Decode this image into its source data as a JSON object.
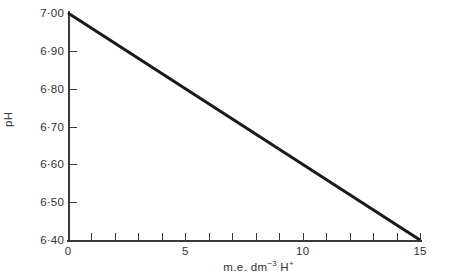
{
  "chart_data": {
    "type": "line",
    "title": "",
    "subtitle": "",
    "xlabel_parts": {
      "base": "m.e. dm",
      "exponent": "−3",
      "species": " H",
      "charge": "+"
    },
    "xlabel": "m.e. dm−3 H+",
    "ylabel": "pH",
    "xlim": [
      0,
      15
    ],
    "ylim": [
      6.4,
      7.0
    ],
    "grid": false,
    "legend": null,
    "background_color": "#ffffff",
    "axis_color": "#3a3a3a",
    "x_major_ticklabels": [
      "0",
      "5",
      "10",
      "15"
    ],
    "x_major_tickvalues": [
      0,
      5,
      10,
      15
    ],
    "x_all_tickvalues": [
      0,
      1,
      2,
      3,
      4,
      5,
      6,
      7,
      8,
      9,
      10,
      11,
      12,
      13,
      14,
      15
    ],
    "y_ticklabels": [
      "6·40",
      "6·50",
      "6·60",
      "6·70",
      "6·80",
      "6·90",
      "7·00"
    ],
    "y_tickvalues": [
      6.4,
      6.5,
      6.6,
      6.7,
      6.8,
      6.9,
      7.0
    ],
    "y_inner_tickvalues": [
      6.5,
      6.6,
      6.7,
      6.8,
      6.9
    ],
    "series": [
      {
        "name": "pH titration line",
        "color": "#1a1a1a",
        "line_width": 3,
        "x": [
          0,
          15
        ],
        "values": [
          7.0,
          6.4
        ],
        "points": [
          [
            0,
            7.0
          ],
          [
            15,
            6.4
          ]
        ]
      }
    ],
    "annotations": []
  }
}
